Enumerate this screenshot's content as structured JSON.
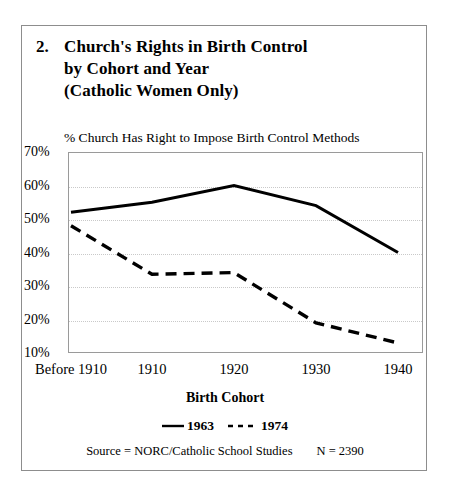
{
  "figure": {
    "number": "2.",
    "title_lines": [
      "Church's Rights in Birth Control",
      "by Cohort and Year",
      "(Catholic Women Only)"
    ],
    "axis_caption": "% Church Has Right to Impose Birth Control Methods",
    "xaxis_title": "Birth Cohort",
    "source_text": "Source = NORC/Catholic School Studies",
    "sample_size": "N = 2390",
    "legend": [
      {
        "label": "1963",
        "style": "solid",
        "swatch": "solid-line-swatch"
      },
      {
        "label": "1974",
        "style": "dashed",
        "swatch": "dashed-line-swatch"
      }
    ],
    "colors": {
      "line": "#000000",
      "grid": "#c9c9c9",
      "plot_border": "#9a9a9a",
      "outer_border": "#8d8d8d",
      "background": "#ffffff"
    }
  },
  "chart_data": {
    "type": "line",
    "title": "Church's Rights in Birth Control by Cohort and Year (Catholic Women Only)",
    "subtitle": "% Church Has Right to Impose Birth Control Methods",
    "xlabel": "Birth Cohort",
    "ylabel": "% Church Has Right to Impose Birth Control Methods",
    "categories": [
      "Before 1910",
      "1910",
      "1920",
      "1930",
      "1940"
    ],
    "series": [
      {
        "name": "1963",
        "style": "solid",
        "values": [
          52,
          55,
          60,
          54,
          40
        ]
      },
      {
        "name": "1974",
        "style": "dashed",
        "values": [
          48,
          33.5,
          34,
          19,
          13
        ]
      }
    ],
    "ylim": [
      10,
      70
    ],
    "yticks": [
      70,
      60,
      50,
      40,
      30,
      20,
      10
    ],
    "ytick_labels": [
      "70%",
      "60%",
      "50%",
      "40%",
      "30%",
      "20%",
      "10%"
    ],
    "grid": "horizontal-dotted",
    "legend_position": "below-axis",
    "annotations": [
      "Source = NORC/Catholic School Studies",
      "N = 2390"
    ]
  }
}
